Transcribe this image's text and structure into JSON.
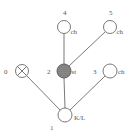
{
  "diagram": {
    "type": "tree",
    "nodes": [
      {
        "id": "0",
        "label": "0",
        "tag": "",
        "style": "crossed",
        "x": 22,
        "y": 71
      },
      {
        "id": "1",
        "label": "1",
        "tag": "K/L",
        "style": "open",
        "x": 65,
        "y": 115
      },
      {
        "id": "2",
        "label": "2",
        "tag": "st",
        "style": "filled",
        "x": 64,
        "y": 71
      },
      {
        "id": "3",
        "label": "3",
        "tag": "ch",
        "style": "open",
        "x": 110,
        "y": 71
      },
      {
        "id": "4",
        "label": "4",
        "tag": "ch",
        "style": "open",
        "x": 64,
        "y": 27
      },
      {
        "id": "5",
        "label": "5",
        "tag": "ch",
        "style": "open",
        "x": 110,
        "y": 27
      }
    ],
    "edges": [
      {
        "from": "1",
        "to": "0"
      },
      {
        "from": "1",
        "to": "2"
      },
      {
        "from": "1",
        "to": "3"
      },
      {
        "from": "2",
        "to": "4"
      },
      {
        "from": "2",
        "to": "5"
      }
    ],
    "colors": {
      "stroke": "#6a6a6a",
      "filled_node": "#7a7a7a",
      "text": "#555555"
    }
  }
}
